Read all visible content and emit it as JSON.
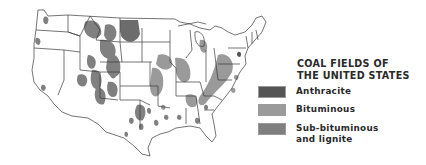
{
  "map": {
    "title_line1": "COAL FIELDS OF",
    "title_line2": "THE UNITED STATES",
    "legend": [
      {
        "label": "Anthracite",
        "color": "#555555"
      },
      {
        "label": "Bituminous",
        "color": "#9a9a9a"
      },
      {
        "label": "Sub-bituminous",
        "label_line2": "and lignite",
        "color": "#7f7f7f"
      }
    ],
    "colors": {
      "background": "#ffffff",
      "state_lines": "#3a3a3a",
      "anthracite": "#555555",
      "bituminous": "#9a9a9a",
      "subbituminous": "#7f7f7f"
    }
  }
}
